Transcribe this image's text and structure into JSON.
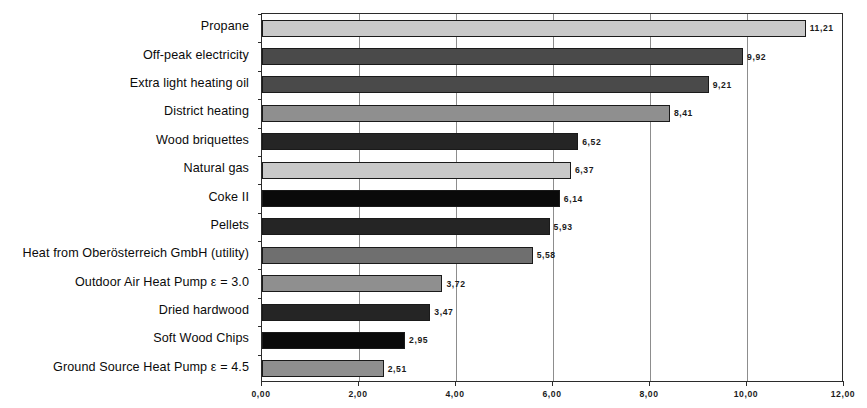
{
  "chart_data": {
    "type": "bar",
    "orientation": "horizontal",
    "title": "",
    "subtitle": "",
    "xlabel": "",
    "ylabel": "",
    "xlim": [
      0,
      12
    ],
    "xticks": [
      0,
      2,
      4,
      6,
      8,
      10,
      12
    ],
    "xtick_labels": [
      "0,00",
      "2,00",
      "4,00",
      "6,00",
      "8,00",
      "10,00",
      "12,00"
    ],
    "grid": true,
    "grid_axis": "x",
    "legend": false,
    "decimal_separator": ",",
    "categories": [
      "Propane",
      "Off-peak electricity",
      "Extra light heating oil",
      "District heating",
      "Wood briquettes",
      "Natural gas",
      "Coke II",
      "Pellets",
      "Heat from Oberösterreich GmbH (utility)",
      "Outdoor Air Heat Pump ε = 3.0",
      "Dried hardwood",
      "Soft Wood Chips",
      "Ground Source Heat Pump ε = 4.5"
    ],
    "values": [
      11.21,
      9.92,
      9.21,
      8.41,
      6.52,
      6.37,
      6.14,
      5.93,
      5.58,
      3.72,
      3.47,
      2.95,
      2.51
    ],
    "value_labels": [
      "11,21",
      "9,92",
      "9,21",
      "8,41",
      "6,52",
      "6,37",
      "6,14",
      "5,93",
      "5,58",
      "3,72",
      "3,47",
      "2,95",
      "2,51"
    ],
    "bar_shades": [
      "sw-light",
      "sw-dark",
      "sw-dark",
      "sw-medium",
      "sw-verydark",
      "sw-light",
      "sw-black",
      "sw-verydark",
      "sw-mediumdark",
      "sw-medium",
      "sw-verydark",
      "sw-black",
      "sw-medium"
    ],
    "colors": {
      "sw-light": "#c9c9c9",
      "sw-medium": "#8f8f8f",
      "sw-mediumdark": "#6f6f6f",
      "sw-dark": "#4a4a4a",
      "sw-verydark": "#252525",
      "sw-black": "#0a0a0a",
      "axis": "#2b2b2b",
      "grid": "#8d8d8d",
      "text": "#0b0b0b",
      "background": "#ffffff"
    }
  }
}
